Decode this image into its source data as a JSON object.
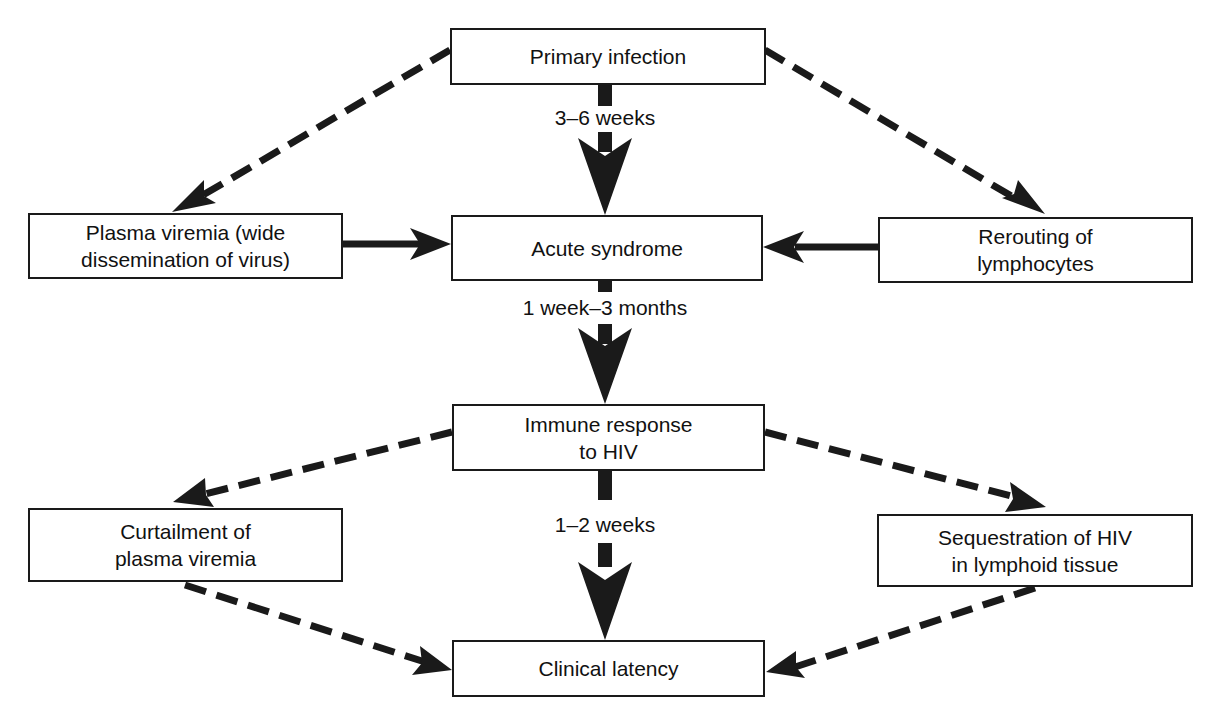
{
  "nodes": {
    "primary_infection": {
      "label": "Primary infection"
    },
    "plasma_viremia": {
      "label": "Plasma viremia (wide\ndissemination of virus)"
    },
    "acute_syndrome": {
      "label": "Acute syndrome"
    },
    "rerouting": {
      "label": "Rerouting of\nlymphocytes"
    },
    "immune_response": {
      "label": "Immune response\nto HIV"
    },
    "curtailment": {
      "label": "Curtailment of\nplasma viremia"
    },
    "sequestration": {
      "label": "Sequestration of HIV\nin lymphoid tissue"
    },
    "clinical_latency": {
      "label": "Clinical latency"
    }
  },
  "edges": {
    "e1": {
      "from": "Primary infection",
      "to": "Acute syndrome",
      "style": "solid-bold",
      "label": "3–6 weeks"
    },
    "e2": {
      "from": "Primary infection",
      "to": "Plasma viremia (wide dissemination of virus)",
      "style": "dashed"
    },
    "e3": {
      "from": "Primary infection",
      "to": "Rerouting of lymphocytes",
      "style": "dashed"
    },
    "e4": {
      "from": "Plasma viremia (wide dissemination of virus)",
      "to": "Acute syndrome",
      "style": "solid"
    },
    "e5": {
      "from": "Rerouting of lymphocytes",
      "to": "Acute syndrome",
      "style": "solid"
    },
    "e6": {
      "from": "Acute syndrome",
      "to": "Immune response to HIV",
      "style": "solid-bold",
      "label": "1 week–3 months"
    },
    "e7": {
      "from": "Immune response to HIV",
      "to": "Curtailment of plasma viremia",
      "style": "dashed"
    },
    "e8": {
      "from": "Immune response to HIV",
      "to": "Sequestration of HIV in lymphoid tissue",
      "style": "dashed"
    },
    "e9": {
      "from": "Immune response to HIV",
      "to": "Clinical latency",
      "style": "solid-bold",
      "label": "1–2 weeks"
    },
    "e10": {
      "from": "Curtailment of plasma viremia",
      "to": "Clinical latency",
      "style": "dashed"
    },
    "e11": {
      "from": "Sequestration of HIV in lymphoid tissue",
      "to": "Clinical latency",
      "style": "dashed"
    }
  },
  "colors": {
    "ink": "#1a1a1a",
    "background": "#ffffff"
  }
}
